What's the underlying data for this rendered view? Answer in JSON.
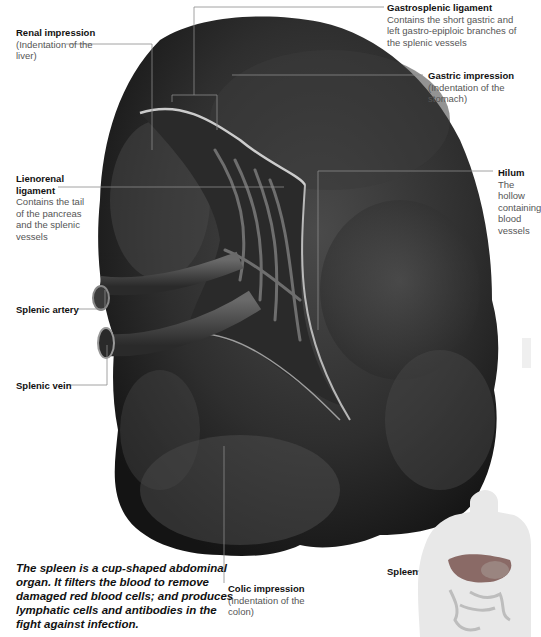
{
  "figure": {
    "labels": [
      {
        "id": "renal-impression",
        "title": "Renal impression",
        "desc": "(Indentation of the liver)"
      },
      {
        "id": "gastrosplenic-ligament",
        "title": "Gastrosplenic ligament",
        "desc": "Contains the short gastric and left gastro-epiploic branches of the splenic vessels"
      },
      {
        "id": "gastric-impression",
        "title": "Gastric impression",
        "desc": "(Indentation of the stomach)"
      },
      {
        "id": "lienorenal-ligament",
        "title": "Lienorenal ligament",
        "desc": "Contains the tail of the pancreas and the splenic vessels"
      },
      {
        "id": "hilum",
        "title": "Hilum",
        "desc": "The hollow containing blood vessels"
      },
      {
        "id": "splenic-artery",
        "title": "Splenic artery",
        "desc": ""
      },
      {
        "id": "splenic-vein",
        "title": "Splenic vein",
        "desc": ""
      },
      {
        "id": "colic-impression",
        "title": "Colic impression",
        "desc": "(Indentation of the colon)"
      },
      {
        "id": "spleen-inset",
        "title": "Spleen",
        "desc": ""
      }
    ],
    "caption": "The spleen is a cup-shaped abdominal organ. It filters the blood to remove damaged red blood cells; and produces lymphatic cells and antibodies in the fight against infection."
  },
  "colors": {
    "organ_dark": "#1e1e1e",
    "organ_mid": "#3c3c3c",
    "organ_light": "#5a5a5a",
    "leader_line": "#8a8a8a",
    "inset_body": "#e6e6e6"
  }
}
